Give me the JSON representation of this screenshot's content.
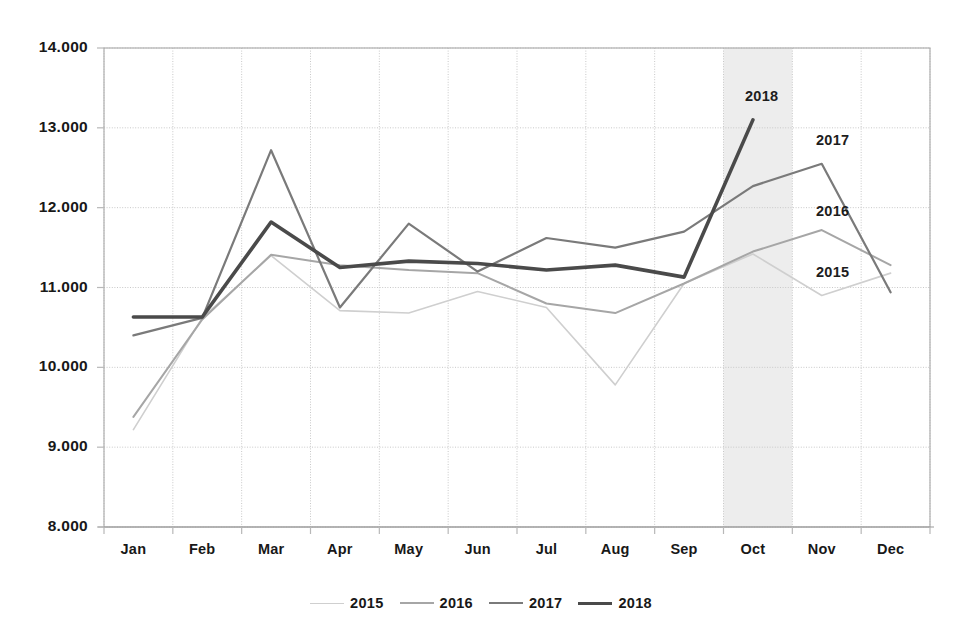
{
  "chart_data": {
    "type": "line",
    "title": "",
    "xlabel": "",
    "ylabel": "",
    "categories": [
      "Jan",
      "Feb",
      "Mar",
      "Apr",
      "May",
      "Jun",
      "Jul",
      "Aug",
      "Sep",
      "Oct",
      "Nov",
      "Dec"
    ],
    "ylim": [
      8000,
      14000
    ],
    "ytick_step": 1000,
    "ytick_labels": [
      "14.000",
      "13.000",
      "12.000",
      "11.000",
      "10.000",
      "9.000",
      "8.000"
    ],
    "ytick_values": [
      14000,
      13000,
      12000,
      11000,
      10000,
      9000,
      8000
    ],
    "grid": true,
    "legend_position": "bottom",
    "highlight_band": {
      "category": "Oct",
      "color": "#ededed"
    },
    "series": [
      {
        "name": "2015",
        "color": "#cfcfcf",
        "width": 1.6,
        "inline_label": "2015",
        "values": [
          9220,
          10620,
          11400,
          10710,
          10680,
          10950,
          10750,
          9780,
          11050,
          11420,
          10900,
          11180
        ]
      },
      {
        "name": "2016",
        "color": "#a6a6a6",
        "width": 2.0,
        "inline_label": "2016",
        "values": [
          9380,
          10600,
          11410,
          11280,
          11220,
          11180,
          10800,
          10680,
          11050,
          11450,
          11720,
          11280
        ]
      },
      {
        "name": "2017",
        "color": "#7a7a7a",
        "width": 2.2,
        "inline_label": "2017",
        "values": [
          10400,
          10620,
          12720,
          10750,
          11800,
          11200,
          11620,
          11500,
          11700,
          12270,
          12550,
          10940
        ]
      },
      {
        "name": "2018",
        "color": "#4a4a4a",
        "width": 3.6,
        "inline_label": "2018",
        "values": [
          10630,
          10630,
          11820,
          11250,
          11330,
          11300,
          11220,
          11280,
          11130,
          13100,
          null,
          null
        ]
      }
    ]
  },
  "legend": {
    "items": [
      {
        "label": "2015",
        "color": "#cfcfcf",
        "width": 1.6
      },
      {
        "label": "2016",
        "color": "#a6a6a6",
        "width": 2.0
      },
      {
        "label": "2017",
        "color": "#7a7a7a",
        "width": 2.2
      },
      {
        "label": "2018",
        "color": "#4a4a4a",
        "width": 3.6
      }
    ]
  },
  "inline_labels": [
    {
      "text": "2018",
      "x": 745,
      "y": 88
    },
    {
      "text": "2017",
      "x": 816,
      "y": 132
    },
    {
      "text": "2016",
      "x": 816,
      "y": 203
    },
    {
      "text": "2015",
      "x": 816,
      "y": 264
    }
  ],
  "axis": {
    "grid_color": "#c8c8c8",
    "frame_color": "#b0b0b0",
    "tick_color": "#b8b8b8"
  }
}
